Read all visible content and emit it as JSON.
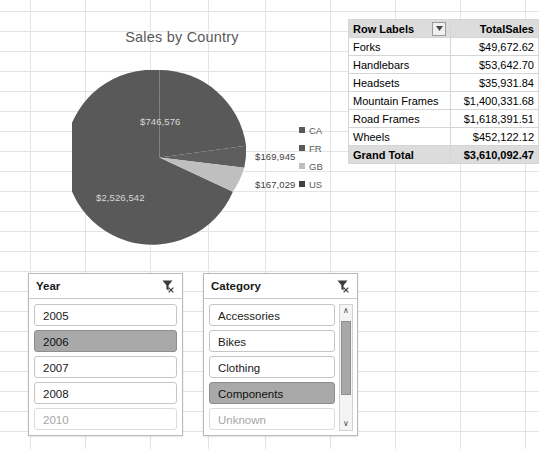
{
  "chart_data": {
    "type": "pie",
    "title": "Sales by Country",
    "categories": [
      "CA",
      "FR",
      "GB",
      "US"
    ],
    "values": [
      746576,
      169945,
      167029,
      2526542
    ],
    "labels": [
      "$746,576",
      "$169,945",
      "$167,029",
      "$2,526,542"
    ],
    "colors": [
      "#595959",
      "#595959",
      "#bfbfbf",
      "#595959"
    ],
    "legend_position": "right",
    "grid": false,
    "xlabel": "",
    "ylabel": ""
  },
  "chart": {
    "title": "Sales by Country",
    "slices": [
      {
        "name": "CA",
        "label": "$746,576",
        "value": 746576,
        "color": "#595959",
        "label_class": "on-dark",
        "label_x": "118px",
        "label_y": "46px"
      },
      {
        "name": "FR",
        "label": "$169,945",
        "value": 169945,
        "color": "#595959",
        "label_class": "outside",
        "label_x": "233px",
        "label_y": "113px"
      },
      {
        "name": "GB",
        "label": "$167,029",
        "value": 167029,
        "color": "#bfbfbf",
        "label_class": "outside",
        "label_x": "233px",
        "label_y": "142px"
      },
      {
        "name": "US",
        "label": "$2,526,542",
        "value": 2526542,
        "color": "#595959",
        "label_class": "on-dark",
        "label_x": "74px",
        "label_y": "163px"
      }
    ],
    "legend": [
      {
        "label": "CA",
        "color": "#595959"
      },
      {
        "label": "FR",
        "color": "#595959"
      },
      {
        "label": "GB",
        "color": "#bfbfbf"
      },
      {
        "label": "US",
        "color": "#404040"
      }
    ]
  },
  "pivot": {
    "columns": [
      "Row Labels",
      "TotalSales"
    ],
    "filter_icon": "filter-dropdown-icon",
    "rows": [
      {
        "label": "Forks",
        "value": "$49,672.62"
      },
      {
        "label": "Handlebars",
        "value": "$53,642.70"
      },
      {
        "label": "Headsets",
        "value": "$35,931.84"
      },
      {
        "label": "Mountain Frames",
        "value": "$1,400,331.68"
      },
      {
        "label": "Road Frames",
        "value": "$1,618,391.51"
      },
      {
        "label": "Wheels",
        "value": "$452,122.12"
      }
    ],
    "total": {
      "label": "Grand Total",
      "value": "$3,610,092.47"
    }
  },
  "slicers": [
    {
      "id": "year",
      "title": "Year",
      "clear_icon": "clear-filter-icon",
      "has_scrollbar": false,
      "items": [
        {
          "label": "2005",
          "state": "normal"
        },
        {
          "label": "2006",
          "state": "selected"
        },
        {
          "label": "2007",
          "state": "normal"
        },
        {
          "label": "2008",
          "state": "normal"
        },
        {
          "label": "2010",
          "state": "disabled"
        }
      ]
    },
    {
      "id": "category",
      "title": "Category",
      "clear_icon": "clear-filter-icon",
      "has_scrollbar": true,
      "scroll_up_glyph": "∧",
      "scroll_down_glyph": "∨",
      "items": [
        {
          "label": "Accessories",
          "state": "normal"
        },
        {
          "label": "Bikes",
          "state": "normal"
        },
        {
          "label": "Clothing",
          "state": "normal"
        },
        {
          "label": "Components",
          "state": "selected"
        },
        {
          "label": "Unknown",
          "state": "disabled"
        }
      ]
    }
  ],
  "grid": {
    "row_height": 20,
    "h_lines": [
      11,
      31,
      51,
      71,
      91,
      111,
      131,
      151,
      171,
      191,
      211,
      231,
      251,
      271,
      291,
      311,
      331,
      351,
      371,
      391,
      411,
      431
    ],
    "v_lines": [
      30,
      85,
      150,
      208,
      265,
      330,
      395,
      460,
      525
    ]
  }
}
